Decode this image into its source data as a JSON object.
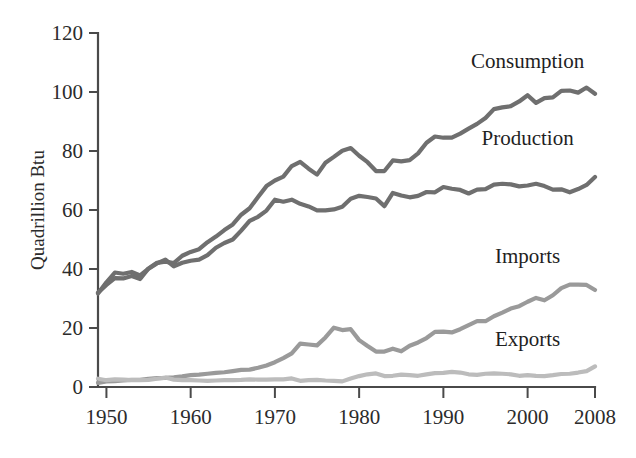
{
  "chart_data": {
    "type": "line",
    "title": "",
    "xlabel": "",
    "ylabel": "Quadrillion Btu",
    "xlim": [
      1949,
      2008
    ],
    "ylim": [
      0,
      120
    ],
    "xticks": [
      1950,
      1960,
      1970,
      1980,
      1990,
      2000,
      2008
    ],
    "xtick_labels": [
      "1950",
      "1960",
      "1970",
      "1980",
      "1990",
      "2000",
      "2008"
    ],
    "yticks": [
      0,
      20,
      40,
      60,
      80,
      100,
      120
    ],
    "ytick_labels": [
      "0",
      "20",
      "40",
      "60",
      "80",
      "100",
      "120"
    ],
    "grid": false,
    "legend_position": "inline-right-of-series",
    "x": [
      1949,
      1950,
      1951,
      1952,
      1953,
      1954,
      1955,
      1956,
      1957,
      1958,
      1959,
      1960,
      1961,
      1962,
      1963,
      1964,
      1965,
      1966,
      1967,
      1968,
      1969,
      1970,
      1971,
      1972,
      1973,
      1974,
      1975,
      1976,
      1977,
      1978,
      1979,
      1980,
      1981,
      1982,
      1983,
      1984,
      1985,
      1986,
      1987,
      1988,
      1989,
      1990,
      1991,
      1992,
      1993,
      1994,
      1995,
      1996,
      1997,
      1998,
      1999,
      2000,
      2001,
      2002,
      2003,
      2004,
      2005,
      2006,
      2007,
      2008
    ],
    "series": [
      {
        "name": "Consumption",
        "color": "#6f6f6f",
        "label_x": 2000,
        "label_y": 108,
        "values": [
          32.0,
          34.6,
          36.9,
          36.8,
          37.6,
          36.6,
          40.2,
          42.1,
          42.5,
          42.0,
          44.5,
          45.8,
          46.7,
          49.1,
          51.0,
          53.2,
          55.1,
          58.4,
          60.6,
          64.4,
          68.1,
          70.0,
          71.3,
          74.9,
          76.3,
          74.0,
          72.0,
          76.0,
          78.0,
          80.1,
          81.0,
          78.4,
          76.2,
          73.2,
          73.2,
          76.8,
          76.5,
          76.9,
          79.2,
          82.8,
          84.9,
          84.5,
          84.5,
          85.9,
          87.6,
          89.2,
          91.2,
          94.2,
          94.8,
          95.2,
          96.8,
          98.9,
          96.3,
          97.9,
          98.2,
          100.4,
          100.5,
          99.8,
          101.5,
          99.4
        ]
      },
      {
        "name": "Production",
        "color": "#6f6f6f",
        "label_x": 2000,
        "label_y": 82,
        "values": [
          31.7,
          35.5,
          38.8,
          38.4,
          39.0,
          37.8,
          40.1,
          41.9,
          43.2,
          40.9,
          42.1,
          42.8,
          43.2,
          44.7,
          47.2,
          48.8,
          50.0,
          53.0,
          56.3,
          57.7,
          59.8,
          63.5,
          62.8,
          63.5,
          62.1,
          61.2,
          59.9,
          59.9,
          60.2,
          61.1,
          63.8,
          64.8,
          64.4,
          63.9,
          61.3,
          65.8,
          64.9,
          64.3,
          64.8,
          66.1,
          66.0,
          67.8,
          67.2,
          66.8,
          65.6,
          66.9,
          67.1,
          68.6,
          68.9,
          68.7,
          68.0,
          68.3,
          68.9,
          68.1,
          66.9,
          67.0,
          66.0,
          67.1,
          68.5,
          71.2
        ]
      },
      {
        "name": "Imports",
        "color": "#9a9a9a",
        "label_x": 2000,
        "label_y": 42,
        "values": [
          1.4,
          1.9,
          2.0,
          2.2,
          2.4,
          2.4,
          2.8,
          3.0,
          3.1,
          3.3,
          3.6,
          4.0,
          4.2,
          4.5,
          4.8,
          5.0,
          5.4,
          5.8,
          5.9,
          6.5,
          7.3,
          8.4,
          9.8,
          11.4,
          14.7,
          14.4,
          14.1,
          16.8,
          20.1,
          19.3,
          19.6,
          15.9,
          13.9,
          12.0,
          12.0,
          13.0,
          12.1,
          14.0,
          15.1,
          16.6,
          18.7,
          18.8,
          18.5,
          19.6,
          21.0,
          22.3,
          22.3,
          24.0,
          25.2,
          26.6,
          27.4,
          28.9,
          30.2,
          29.4,
          31.1,
          33.5,
          34.7,
          34.7,
          34.6,
          32.9
        ]
      },
      {
        "name": "Exports",
        "color": "#bcbcbc",
        "label_x": 2000,
        "label_y": 14,
        "values": [
          2.8,
          2.3,
          2.6,
          2.5,
          2.3,
          2.3,
          2.4,
          2.8,
          3.2,
          2.5,
          2.3,
          2.3,
          2.2,
          2.1,
          2.2,
          2.3,
          2.3,
          2.4,
          2.6,
          2.5,
          2.5,
          2.6,
          2.6,
          2.9,
          2.1,
          2.3,
          2.4,
          2.2,
          2.1,
          1.9,
          2.9,
          3.7,
          4.3,
          4.6,
          3.7,
          3.8,
          4.2,
          4.0,
          3.8,
          4.3,
          4.7,
          4.8,
          5.1,
          4.9,
          4.3,
          4.1,
          4.5,
          4.6,
          4.5,
          4.3,
          3.8,
          4.0,
          3.8,
          3.7,
          4.0,
          4.4,
          4.5,
          4.9,
          5.4,
          7.0
        ]
      }
    ]
  },
  "axis": {
    "y_title": "Quadrillion Btu"
  }
}
